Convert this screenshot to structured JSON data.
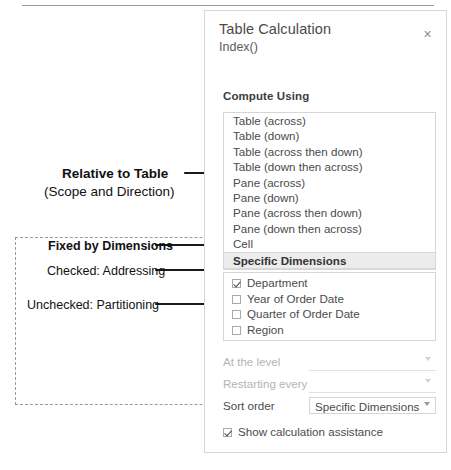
{
  "dialog": {
    "title": "Table Calculation",
    "subtitle": "Index()",
    "close_icon": "close-icon",
    "close_glyph": "×",
    "compute_using_label": "Compute Using",
    "compute_using_options": [
      {
        "label": "Table (across)",
        "selected": false
      },
      {
        "label": "Table (down)",
        "selected": false
      },
      {
        "label": "Table (across then down)",
        "selected": false
      },
      {
        "label": "Table (down then across)",
        "selected": false
      },
      {
        "label": "Pane (across)",
        "selected": false
      },
      {
        "label": "Pane (down)",
        "selected": false
      },
      {
        "label": "Pane (across then down)",
        "selected": false
      },
      {
        "label": "Pane (down then across)",
        "selected": false
      },
      {
        "label": "Cell",
        "selected": false
      },
      {
        "label": "Specific Dimensions",
        "selected": true
      }
    ],
    "dimensions": [
      {
        "label": "Department",
        "checked": true
      },
      {
        "label": "Year of Order Date",
        "checked": false
      },
      {
        "label": "Quarter of Order Date",
        "checked": false
      },
      {
        "label": "Region",
        "checked": false
      }
    ],
    "fields": [
      {
        "label": "At the level",
        "value": "",
        "disabled": true
      },
      {
        "label": "Restarting every",
        "value": "",
        "disabled": true
      },
      {
        "label": "Sort order",
        "value": "Specific Dimensions",
        "disabled": false
      }
    ],
    "show_assistance": {
      "label": "Show calculation assistance",
      "checked": true
    }
  },
  "annotations": [
    {
      "id": "relative-to-table",
      "line1": "Relative to Table",
      "line2": "(Scope and Direction)"
    },
    {
      "id": "fixed-by-dimensions",
      "text": "Fixed by Dimensions"
    },
    {
      "id": "checked-addressing",
      "prefix": "Checked:",
      "emphasis": "Addressing"
    },
    {
      "id": "unchecked-partitioning",
      "prefix": "Unchecked:",
      "emphasis": "Partitioning"
    }
  ],
  "colors": {
    "panel_border": "#d7d7d7",
    "list_border": "#d6d6d6",
    "selected_row_bg": "#ececec",
    "annotation_ink": "#111111",
    "dashed_border": "#9a9a9a",
    "disabled_text": "#b4b4b4"
  }
}
